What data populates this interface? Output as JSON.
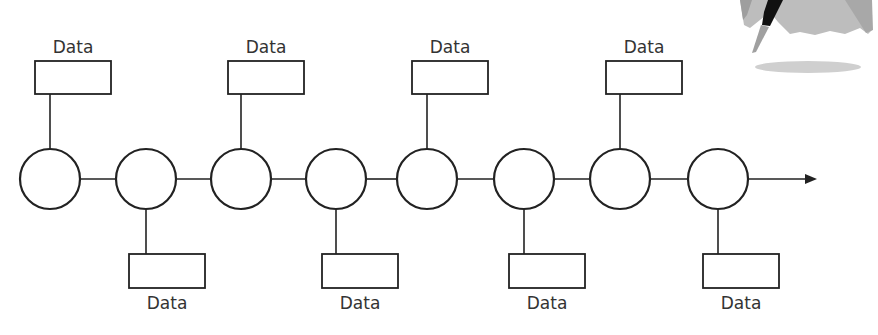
{
  "diagram": {
    "type": "timeline-node-chain",
    "colors": {
      "stroke": "#222222",
      "label": "#333333",
      "background": "#ffffff",
      "figure_light": "#bdbdbd",
      "figure_mid": "#9e9e9e",
      "figure_dark": "#111111",
      "shadow": "#cfcfcf"
    },
    "nodes": [
      {
        "id": 1,
        "data_position": "top",
        "label": "Data"
      },
      {
        "id": 2,
        "data_position": "bottom",
        "label": "Data"
      },
      {
        "id": 3,
        "data_position": "top",
        "label": "Data"
      },
      {
        "id": 4,
        "data_position": "bottom",
        "label": "Data"
      },
      {
        "id": 5,
        "data_position": "top",
        "label": "Data"
      },
      {
        "id": 6,
        "data_position": "bottom",
        "label": "Data"
      },
      {
        "id": 7,
        "data_position": "top",
        "label": "Data"
      },
      {
        "id": 8,
        "data_position": "bottom",
        "label": "Data"
      }
    ],
    "arrow": "right",
    "decoration": "partial-figure-with-shadow-top-right"
  },
  "labels": {
    "top": [
      "Data",
      "Data",
      "Data",
      "Data"
    ],
    "bottom": [
      "Data",
      "Data",
      "Data",
      "Data"
    ]
  }
}
